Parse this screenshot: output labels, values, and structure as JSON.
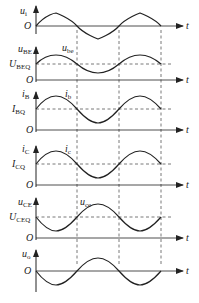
{
  "diagram": {
    "type": "waveform-stack",
    "title": "",
    "time_axis_label": "t",
    "origin_label": "O",
    "dashed_time_markers_x": [
      77,
      119,
      161
    ],
    "panels": [
      {
        "id": "ui",
        "y_label": "u",
        "y_sub": "i",
        "q_label": null,
        "q_sub": null,
        "signal_label": null,
        "signal_sub": null,
        "phase": "in"
      },
      {
        "id": "uBE",
        "y_label": "u",
        "y_sub": "BE",
        "q_label": "U",
        "q_sub": "BEQ",
        "signal_label": "u",
        "signal_sub": "be",
        "phase": "in"
      },
      {
        "id": "iB",
        "y_label": "i",
        "y_sub": "B",
        "q_label": "I",
        "q_sub": "BQ",
        "signal_label": "i",
        "signal_sub": "b",
        "phase": "in"
      },
      {
        "id": "iC",
        "y_label": "i",
        "y_sub": "C",
        "q_label": "I",
        "q_sub": "CQ",
        "signal_label": "i",
        "signal_sub": "c",
        "phase": "in"
      },
      {
        "id": "uCE",
        "y_label": "u",
        "y_sub": "CE",
        "q_label": "U",
        "q_sub": "CEQ",
        "signal_label": "u",
        "signal_sub": "ce",
        "phase": "inverted"
      },
      {
        "id": "uo",
        "y_label": "u",
        "y_sub": "o",
        "q_label": null,
        "q_sub": null,
        "signal_label": null,
        "signal_sub": null,
        "phase": "inverted"
      }
    ]
  },
  "labels": {
    "p1_y": "u",
    "p1_ys": "i",
    "p2_y": "u",
    "p2_ys": "BE",
    "p2_q": "U",
    "p2_qs": "BEQ",
    "p2_s": "u",
    "p2_ss": "be",
    "p3_y": "i",
    "p3_ys": "B",
    "p3_q": "I",
    "p3_qs": "BQ",
    "p3_s": "i",
    "p3_ss": "b",
    "p4_y": "i",
    "p4_ys": "C",
    "p4_q": "I",
    "p4_qs": "CQ",
    "p4_s": "i",
    "p4_ss": "c",
    "p5_y": "u",
    "p5_ys": "CE",
    "p5_q": "U",
    "p5_qs": "CEQ",
    "p5_s": "u",
    "p5_ss": "ce",
    "p6_y": "u",
    "p6_ys": "o",
    "O": "O",
    "t": "t"
  },
  "colors": {
    "stroke": "#222222",
    "dash": "#555555",
    "background": "#ffffff"
  }
}
